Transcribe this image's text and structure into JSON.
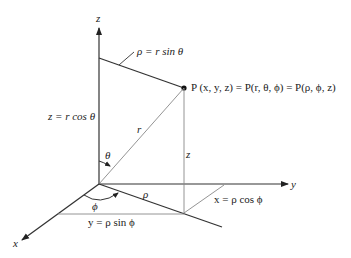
{
  "diagram": {
    "axes": {
      "x_label": "x",
      "y_label": "y",
      "z_label": "z"
    },
    "point": {
      "label": "P (x, y, z) = P(r, θ, ϕ) = P(ρ, ϕ, z)"
    },
    "labels": {
      "rho_eq": "ρ = r sin θ",
      "z_eq": "z = r cos θ",
      "r": "r",
      "theta": "θ",
      "z_seg": "z",
      "phi": "ϕ",
      "rho": "ρ",
      "x_eq": "x = ρ cos ϕ",
      "y_eq": "y = ρ sin ϕ"
    },
    "colors": {
      "line": "#2a2a2a",
      "thin_line": "#777777",
      "background": "#ffffff"
    }
  }
}
